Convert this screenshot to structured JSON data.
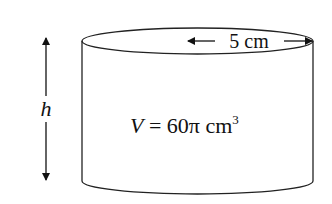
{
  "diagram": {
    "type": "cylinder",
    "radius_label": "5 cm",
    "height_label": "h",
    "volume_label": "V = 60π cm",
    "volume_var": "V",
    "volume_eq": " = 60π cm",
    "volume_exp": "3",
    "colors": {
      "stroke": "#222222",
      "background": "#ffffff"
    }
  }
}
